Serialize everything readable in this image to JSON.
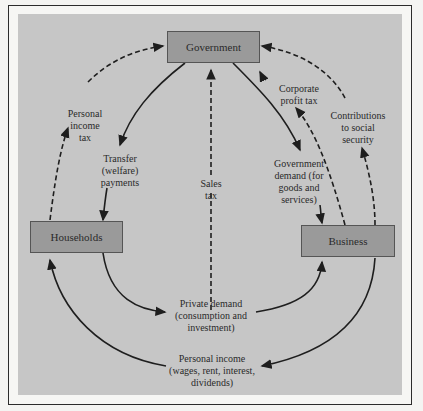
{
  "nodes": {
    "government": "Government",
    "households": "Households",
    "business": "Business"
  },
  "flows": {
    "personal_income_tax": "Personal\nincome\ntax",
    "transfer_payments": "Transfer\n(welfare)\npayments",
    "sales_tax": "Sales\ntax",
    "corporate_profit_tax": "Corporate\nprofit tax",
    "government_demand": "Government\ndemand (for\ngoods and\nservices)",
    "contributions_social_security": "Contributions\nto social\nsecurity",
    "private_demand": "Private demand\n(consumption and\ninvestment)",
    "personal_income": "Personal income\n(wages, rent, interest,\ndividends)"
  },
  "colors": {
    "panel": "#c6c6c6",
    "box": "#9a9a9a",
    "line": "#1e1e1e"
  }
}
